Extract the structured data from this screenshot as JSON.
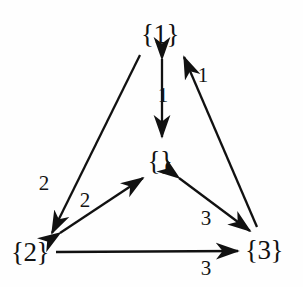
{
  "diagram": {
    "type": "directed-graph",
    "title": "",
    "background_color": "#fefefe",
    "stroke_color": "#111111",
    "nodes": [
      {
        "id": "n1",
        "label": "{1}",
        "x": 160,
        "y": 34
      },
      {
        "id": "nempty",
        "label": "{}",
        "x": 160,
        "y": 161
      },
      {
        "id": "n2",
        "label": "{2}",
        "x": 30,
        "y": 252
      },
      {
        "id": "n3",
        "label": "{3}",
        "x": 264,
        "y": 250
      }
    ],
    "edges": [
      {
        "id": "e-1-empty",
        "from": "n1",
        "to": "nempty",
        "arrow": "double",
        "label": "1",
        "label_x": 163,
        "label_y": 95
      },
      {
        "id": "e-3-1",
        "from": "n3",
        "to": "n1",
        "arrow": "single",
        "label": "1",
        "label_x": 203,
        "label_y": 75
      },
      {
        "id": "e-1-2",
        "from": "n1",
        "to": "n2",
        "arrow": "single",
        "label": "2",
        "label_x": 44,
        "label_y": 183
      },
      {
        "id": "e-2-empty",
        "from": "n2",
        "to": "nempty",
        "arrow": "double",
        "label": "2",
        "label_x": 85,
        "label_y": 200
      },
      {
        "id": "e-empty-3",
        "from": "nempty",
        "to": "n3",
        "arrow": "double",
        "label": "3",
        "label_x": 206,
        "label_y": 218
      },
      {
        "id": "e-2-3",
        "from": "n2",
        "to": "n3",
        "arrow": "single",
        "label": "3",
        "label_x": 206,
        "label_y": 268
      }
    ]
  }
}
